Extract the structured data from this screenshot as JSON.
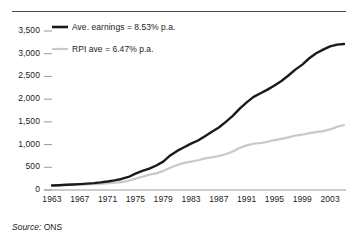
{
  "figure": {
    "source_prefix": "Source:",
    "source_value": "ONS"
  },
  "colors": {
    "earnings_line": "#1a1a1a",
    "rpi_line": "#c9c9c9",
    "axis": "#9a9a9a",
    "top_rule": "#4a4a4a",
    "text": "#1b1b1b"
  },
  "chart_data": {
    "type": "line",
    "title": "",
    "subtitle": "",
    "xlabel": "",
    "ylabel": "",
    "xlim": [
      1963,
      2005
    ],
    "ylim": [
      0,
      3500
    ],
    "grid": false,
    "legend_position": "top-left",
    "y_ticks": [
      "0",
      "500",
      "1,000",
      "1,500",
      "2,000",
      "2,500",
      "3,000",
      "3,500"
    ],
    "y_tick_values": [
      0,
      500,
      1000,
      1500,
      2000,
      2500,
      3000,
      3500
    ],
    "x_ticks": [
      "1963",
      "1967",
      "1971",
      "1975",
      "1979",
      "1983",
      "1987",
      "1991",
      "1995",
      "1999",
      "2003"
    ],
    "x_tick_values": [
      1963,
      1967,
      1971,
      1975,
      1979,
      1983,
      1987,
      1991,
      1995,
      1999,
      2003
    ],
    "x": [
      1963,
      1964,
      1965,
      1966,
      1967,
      1968,
      1969,
      1970,
      1971,
      1972,
      1973,
      1974,
      1975,
      1976,
      1977,
      1978,
      1979,
      1980,
      1981,
      1982,
      1983,
      1984,
      1985,
      1986,
      1987,
      1988,
      1989,
      1990,
      1991,
      1992,
      1993,
      1994,
      1995,
      1996,
      1997,
      1998,
      1999,
      2000,
      2001,
      2002,
      2003,
      2004,
      2005
    ],
    "series": [
      {
        "name": "Ave. earnings = 8.53% p.a.",
        "legend_label": "Ave. earnings = 8.53% p.a.",
        "rate_pa": "8.53%",
        "color": "#1a1a1a",
        "values": [
          100,
          106,
          114,
          122,
          130,
          140,
          152,
          168,
          188,
          212,
          243,
          287,
          360,
          420,
          470,
          540,
          625,
          760,
          860,
          940,
          1020,
          1090,
          1185,
          1280,
          1375,
          1500,
          1630,
          1790,
          1930,
          2050,
          2130,
          2210,
          2300,
          2400,
          2520,
          2650,
          2760,
          2900,
          3010,
          3090,
          3160,
          3200,
          3215
        ]
      },
      {
        "name": "RPI ave = 6.47% p.a.",
        "legend_label": "RPI ave = 6.47% p.a.",
        "rate_pa": "6.47%",
        "color": "#c9c9c9",
        "values": [
          100,
          103,
          108,
          112,
          116,
          121,
          128,
          136,
          149,
          159,
          174,
          202,
          251,
          293,
          339,
          367,
          416,
          491,
          550,
          597,
          624,
          655,
          695,
          719,
          749,
          786,
          848,
          928,
          982,
          1019,
          1035,
          1061,
          1098,
          1124,
          1159,
          1198,
          1217,
          1252,
          1275,
          1296,
          1334,
          1390,
          1430
        ]
      }
    ],
    "legend": [
      {
        "label": "Ave. earnings = 8.53% p.a.",
        "color": "#1a1a1a",
        "width": 2.6
      },
      {
        "label": "RPI ave = 6.47% p.a.",
        "color": "#c9c9c9",
        "width": 2.2
      }
    ]
  }
}
